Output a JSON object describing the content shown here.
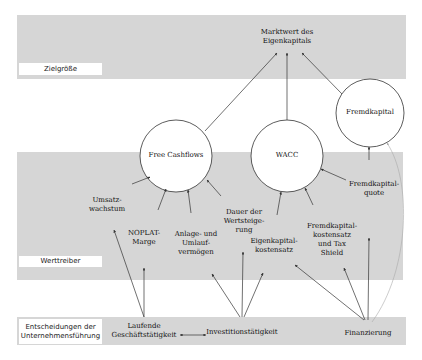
{
  "bands": {
    "target": {
      "label": "Zielgröße"
    },
    "drivers": {
      "label": "Werttreiber"
    },
    "decisions": {
      "label": "Entscheidungen der Unternehmensführung"
    }
  },
  "nodes": {
    "equity_value": "Marktwert des Eigenkapitals",
    "free_cashflows": "Free Cashflows",
    "wacc": "WACC",
    "debt": "Fremdkapital",
    "revenue_growth": "Umsatz-wachstum",
    "noplat_margin": "NOPLAT-Marge",
    "assets": "Anlage- und Umlauf-vermögen",
    "growth_duration": "Dauer der Wertsteige-rung",
    "cost_of_equity": "Eigenkapital-kostensatz",
    "cost_of_debt": "Fremdkapital-kostensatz und Tax Shield",
    "debt_ratio": "Fremdkapital-quote",
    "operations": "Laufende Geschäftstätigkeit",
    "investment": "Investitionstätigkeit",
    "financing": "Finanzierung"
  },
  "lines": {
    "nodes": {
      "equity_value": [
        "Marktwert des",
        "Eigenkapitals"
      ],
      "revenue_growth": [
        "Umsatz-",
        "wachstum"
      ],
      "noplat_margin": [
        "NOPLAT-",
        "Marge"
      ],
      "assets": [
        "Anlage- und",
        "Umlauf-",
        "vermögen"
      ],
      "growth_duration": [
        "Dauer der",
        "Wertsteige-",
        "rung"
      ],
      "cost_of_equity": [
        "Eigenkapital-",
        "kostensatz"
      ],
      "cost_of_debt": [
        "Fremdkapital-",
        "kostensatz",
        "und Tax",
        "Shield"
      ],
      "debt_ratio": [
        "Fremdkapital-",
        "quote"
      ],
      "operations": [
        "Laufende",
        "Geschäftstätigkeit"
      ],
      "decisions_label": [
        "Entscheidungen der",
        "Unternehmensführung"
      ]
    }
  },
  "colors": {
    "band": "#d6d6d6",
    "line": "#333333",
    "curve": "#b0b0b0"
  }
}
